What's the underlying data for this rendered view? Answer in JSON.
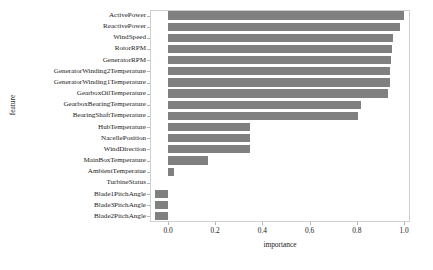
{
  "chart_data": {
    "type": "bar",
    "orientation": "horizontal",
    "title": "",
    "xlabel": "importance",
    "ylabel": "feature",
    "xlim": [
      -0.076,
      1.026
    ],
    "xticks": [
      0.0,
      0.2,
      0.4,
      0.6,
      0.8,
      1.0
    ],
    "xtick_labels": [
      "0.0",
      "0.2",
      "0.4",
      "0.6",
      "0.8",
      "1.0"
    ],
    "grid": false,
    "legend": null,
    "bar_color": "#808080",
    "frame_color": "#cfcfcf",
    "categories": [
      "ActivePower",
      "ReactivePower",
      "WindSpeed",
      "RotorRPM",
      "GeneratorRPM",
      "GeneratorWinding2Temperature",
      "GeneratorWinding1Temperature",
      "GearboxOilTemperature",
      "GearboxBearingTemperature",
      "BearingShaftTemperature",
      "HubTemperature",
      "NacellePosition",
      "WindDirection",
      "MainBoxTemperature",
      "AmbientTemperatue",
      "TurbineStatus",
      "Blade1PitchAngle",
      "Blade3PitchAngle",
      "Blade2PitchAngle"
    ],
    "values": [
      1.0,
      0.983,
      0.953,
      0.949,
      0.945,
      0.941,
      0.941,
      0.932,
      0.818,
      0.805,
      0.347,
      0.347,
      0.347,
      0.169,
      0.025,
      0.0,
      -0.055,
      -0.055,
      -0.055
    ]
  }
}
